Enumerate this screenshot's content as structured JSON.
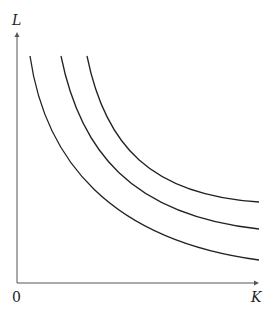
{
  "diagram": {
    "y_axis_label": "L",
    "x_axis_label": "K",
    "origin_label": "0",
    "curves": [
      {
        "name": "isoquant-1",
        "path": "M 30 56 C 45 160, 110 240, 259 260"
      },
      {
        "name": "isoquant-2",
        "path": "M 61 56 C 80 150, 130 215, 259 229"
      },
      {
        "name": "isoquant-3",
        "path": "M 87 56 C 105 145, 150 195, 259 202"
      }
    ],
    "colors": {
      "line": "#222222",
      "axis": "#555555"
    }
  }
}
